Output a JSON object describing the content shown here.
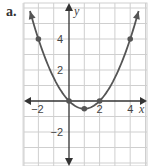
{
  "panel_label": "a.",
  "chart_data": {
    "type": "line",
    "title": "",
    "function": "y = 0.5x^2 - x",
    "xlabel": "x",
    "ylabel": "y",
    "xlim": [
      -3,
      5
    ],
    "ylim": [
      -4.2,
      6.3
    ],
    "grid": true,
    "grid_step": 1,
    "x_tick_labels": [
      {
        "value": -2,
        "label": "−2"
      },
      {
        "value": 2,
        "label": "2"
      },
      {
        "value": 4,
        "label": "4"
      }
    ],
    "y_tick_labels": [
      {
        "value": 4,
        "label": "4"
      },
      {
        "value": 2,
        "label": "2"
      },
      {
        "value": -2,
        "label": "−2"
      }
    ],
    "points": [
      {
        "x": -2,
        "y": 4
      },
      {
        "x": 0,
        "y": 0
      },
      {
        "x": 1,
        "y": -0.5
      },
      {
        "x": 2,
        "y": 0
      },
      {
        "x": 4,
        "y": 4
      }
    ],
    "colors": {
      "curve": "#555555",
      "grid": "#cfcfcf",
      "axis": "#333333"
    }
  }
}
